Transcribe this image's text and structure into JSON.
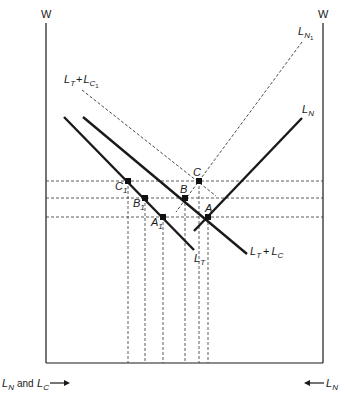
{
  "diagram": {
    "axes": {
      "left_label": "W",
      "right_label": "W",
      "bottom_left_label": "and",
      "bottom_left_L1": "L",
      "bottom_left_sub1": "N",
      "bottom_left_L2": "L",
      "bottom_left_sub2": "C",
      "bottom_right_L": "L",
      "bottom_right_sub": "N"
    },
    "curves": {
      "LT": {
        "main": "L",
        "sub": "T"
      },
      "LTLC": {
        "main1": "L",
        "sub1": "T",
        "plus": "+",
        "main2": "L",
        "sub2": "C"
      },
      "LTLC1": {
        "main1": "L",
        "sub1": "T",
        "plus": "+",
        "main2": "L",
        "sub2": "C",
        "subsub": "1"
      },
      "LN": {
        "main": "L",
        "sub": "N"
      },
      "LN1": {
        "main": "L",
        "sub": "N",
        "subsub": "1"
      }
    },
    "points": {
      "A": "A",
      "B": "B",
      "C": "C",
      "A1": {
        "main": "A",
        "sub": "1"
      },
      "B1": {
        "main": "B",
        "sub": "1"
      },
      "C1": {
        "main": "C",
        "sub": "1"
      }
    },
    "colors": {
      "line": "#1a1a1a",
      "dashed": "#333333"
    }
  }
}
